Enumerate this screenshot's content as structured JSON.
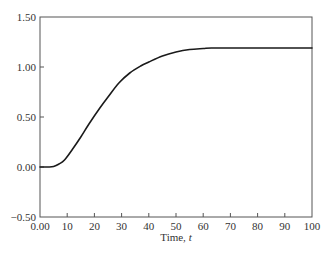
{
  "chart_data": {
    "type": "line",
    "title": "",
    "xlabel": "Time, ",
    "xlabel_italic": "t",
    "ylabel": "",
    "xlim": [
      0,
      100
    ],
    "ylim": [
      -0.5,
      1.5
    ],
    "xticks": [
      0,
      10,
      20,
      30,
      40,
      50,
      60,
      70,
      80,
      90,
      100
    ],
    "xtick_labels": [
      "0.00",
      "10",
      "20",
      "30",
      "40",
      "50",
      "60",
      "70",
      "80",
      "90",
      "100"
    ],
    "yticks": [
      -0.5,
      0,
      0.5,
      1.0,
      1.5
    ],
    "ytick_labels": [
      "−0.50",
      "0.00",
      "0.50",
      "1.00",
      "1.50"
    ],
    "grid": false,
    "legend": null,
    "series": [
      {
        "name": "response",
        "color": "#1a1a1a",
        "x": [
          0,
          3,
          5,
          7,
          9,
          12,
          15,
          18,
          22,
          25,
          29,
          33,
          37,
          40,
          45,
          50,
          55,
          60,
          63,
          70,
          80,
          90,
          100
        ],
        "y": [
          0,
          0,
          0.005,
          0.03,
          0.07,
          0.18,
          0.3,
          0.43,
          0.59,
          0.7,
          0.84,
          0.94,
          1.01,
          1.05,
          1.11,
          1.15,
          1.175,
          1.185,
          1.19,
          1.19,
          1.19,
          1.19,
          1.19
        ]
      }
    ]
  }
}
